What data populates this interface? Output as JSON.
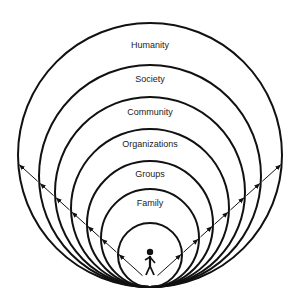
{
  "diagram": {
    "title": "",
    "type": "nested-tangent-circles",
    "tangent_point": {
      "x": 150,
      "y": 287
    },
    "rings": [
      {
        "label": "Humanity",
        "r": 132,
        "label_y": 48
      },
      {
        "label": "Society",
        "r": 111,
        "label_y": 82
      },
      {
        "label": "Community",
        "r": 95,
        "label_y": 115
      },
      {
        "label": "Organizations",
        "r": 79,
        "label_y": 147
      },
      {
        "label": "Groups",
        "r": 63,
        "label_y": 177
      },
      {
        "label": "Family",
        "r": 49,
        "label_y": 206
      },
      {
        "label": "",
        "r": 32,
        "label_y": 0
      }
    ],
    "center_figure": "person-icon",
    "arrows": "outward-left-and-right"
  }
}
